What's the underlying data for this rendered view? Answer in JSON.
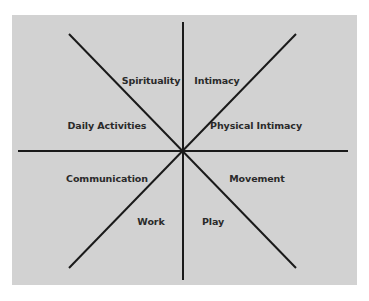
{
  "diagram": {
    "type": "eight-sector wheel",
    "background_color": "#d2d2d2",
    "line_color": "#1a1a1a",
    "sectors": [
      {
        "label": "Spirituality",
        "x": 151,
        "y": 80
      },
      {
        "label": "Intimacy",
        "x": 217,
        "y": 80
      },
      {
        "label": "Daily Activities",
        "x": 107,
        "y": 125
      },
      {
        "label": "Physical Intimacy",
        "x": 256,
        "y": 125
      },
      {
        "label": "Communication",
        "x": 107,
        "y": 178
      },
      {
        "label": "Movement",
        "x": 257,
        "y": 178
      },
      {
        "label": "Work",
        "x": 151,
        "y": 221
      },
      {
        "label": "Play",
        "x": 213,
        "y": 221
      }
    ]
  }
}
